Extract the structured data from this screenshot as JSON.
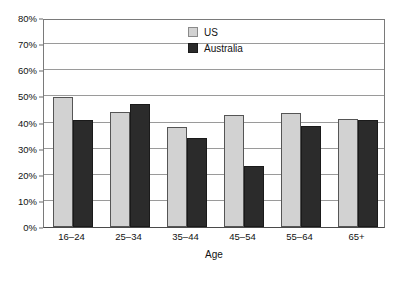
{
  "chart_data": {
    "type": "bar",
    "title": "",
    "subtitle": "",
    "xlabel": "Age",
    "ylabel": "",
    "categories": [
      "16–24",
      "25–34",
      "35–44",
      "45–54",
      "55–64",
      "65+"
    ],
    "series": [
      {
        "name": "US",
        "color": "#d2d2d2",
        "values": [
          49.7,
          44.0,
          38.4,
          42.9,
          43.5,
          41.5
        ]
      },
      {
        "name": "Australia",
        "color": "#2b2b2b",
        "values": [
          41.0,
          47.2,
          34.2,
          23.4,
          38.7,
          41.1
        ]
      }
    ],
    "ylim": [
      0,
      80
    ],
    "ytick_values": [
      0,
      10,
      20,
      30,
      40,
      50,
      60,
      70,
      80
    ],
    "ytick_labels": [
      "0%",
      "10%",
      "20%",
      "30%",
      "40%",
      "50%",
      "60%",
      "70%",
      "80%"
    ],
    "grid": true,
    "grid_axis": "y",
    "legend_position": "upper center inside",
    "value_format": "percent",
    "annotations": []
  },
  "legend": {
    "entries": [
      {
        "label": "US"
      },
      {
        "label": "Australia"
      }
    ]
  },
  "axes": {
    "x_title": "Age"
  },
  "colors": {
    "series_us": "#d2d2d2",
    "series_australia": "#2b2b2b",
    "gridline": "#9a9a9a",
    "axis": "#4a4a4a",
    "background": "#ffffff",
    "text": "#121212"
  }
}
